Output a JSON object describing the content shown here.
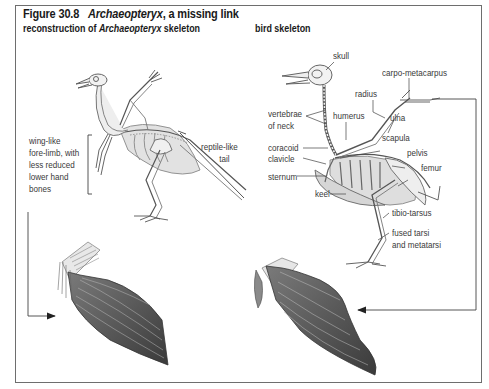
{
  "figure": {
    "number": "Figure 30.8",
    "title_italic": "Archaeopteryx",
    "title_rest": ", a missing link"
  },
  "left_panel": {
    "heading_prefix": "reconstruction of ",
    "heading_italic": "Archaeopteryx",
    "heading_suffix": " skeleton",
    "labels": {
      "forelimb": [
        "wing-like",
        "fore-limb, with",
        "less reduced",
        "lower hand",
        "bones"
      ],
      "tail": [
        "reptile-like",
        "tail"
      ]
    }
  },
  "right_panel": {
    "heading": "bird skeleton",
    "labels": {
      "skull": "skull",
      "carpo_metacarpus": "carpo-metacarpus",
      "radius": "radius",
      "vertebrae": [
        "vertebrae",
        "of neck"
      ],
      "humerus": "humerus",
      "ulna": "ulna",
      "scapula": "scapula",
      "coracoid": "coracoid",
      "clavicle": "clavicle",
      "pelvis": "pelvis",
      "femur": "femur",
      "sternum": "sternum",
      "keel": "keel",
      "tibio_tarsus": "tibio-tarsus",
      "fused_tarsi": [
        "fused tarsi",
        "and metatarsi"
      ]
    }
  },
  "colors": {
    "frame": "#6e6e6e",
    "text": "#1a1a1a",
    "label": "#3a3a3a",
    "bone": "#f2f2f2",
    "body_shade": "#d9d9d9",
    "feather_dark": "#4a4a4a",
    "feather_mid": "#6a6a6a",
    "line": "#555555"
  }
}
